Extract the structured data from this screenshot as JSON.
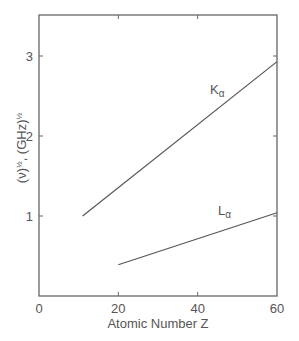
{
  "chart_data": {
    "type": "line",
    "title": "",
    "xlabel": "Atomic Number Z",
    "ylabel": "(ν)½, (GHz)½",
    "xlim": [
      0,
      60
    ],
    "ylim": [
      0,
      3.5
    ],
    "xticks": [
      0,
      20,
      40,
      60
    ],
    "yticks": [
      1,
      2,
      3
    ],
    "xtick_labels": [
      "0",
      "20",
      "40",
      "60"
    ],
    "ytick_labels": [
      "1",
      "2",
      "3"
    ],
    "grid": false,
    "legend": "none (inline labels)",
    "series": [
      {
        "name": "Kα",
        "label_main": "K",
        "label_sub": "α",
        "x": [
          11,
          60
        ],
        "y": [
          1.0,
          2.93
        ]
      },
      {
        "name": "Lα",
        "label_main": "L",
        "label_sub": "α",
        "x": [
          20,
          60
        ],
        "y": [
          0.39,
          1.04
        ]
      }
    ]
  },
  "colors": {
    "axis": "#666666",
    "line": "#555555",
    "text": "#555555",
    "background": "#ffffff"
  }
}
